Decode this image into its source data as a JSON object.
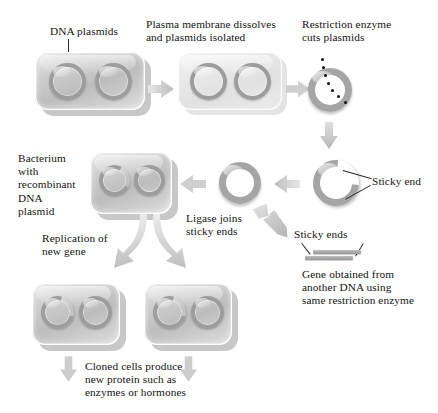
{
  "diagram": {
    "labels": {
      "dna_plasmids": "DNA plasmids",
      "plasma_membrane": "Plasma membrane dissolves\nand plasmids isolated",
      "restriction_enzyme": "Restriction enzyme\ncuts plasmids",
      "sticky_end": "Sticky end",
      "bacterium_recombinant": "Bacterium\nwith\nrecombinant\nDNA\nplasmid",
      "ligase": "Ligase joins\nsticky ends",
      "sticky_ends": "Sticky ends",
      "gene_obtained": "Gene obtained from\nanother DNA using\nsame restriction enzyme",
      "replication": "Replication of\nnew gene",
      "cloned_cells": "Cloned cells produce\nnew protein such as\nenzymes or hormones"
    },
    "icons": {
      "arrow_right": "arrow-right-icon",
      "arrow_left": "arrow-left-icon",
      "arrow_down": "arrow-down-icon",
      "arrow_diagonal": "arrow-diagonal-icon",
      "fork_arrow": "fork-arrow-icon"
    },
    "colors": {
      "cell_fill": "#bdbdbd",
      "cell_light": "#e9e9e9",
      "ring_stroke": "#9d9d9d",
      "plasmid_stroke": "#a5a5a5",
      "arrow_fill": "#c9c9c9",
      "text": "#141414",
      "dot": "#111111",
      "background": "#ffffff"
    }
  }
}
